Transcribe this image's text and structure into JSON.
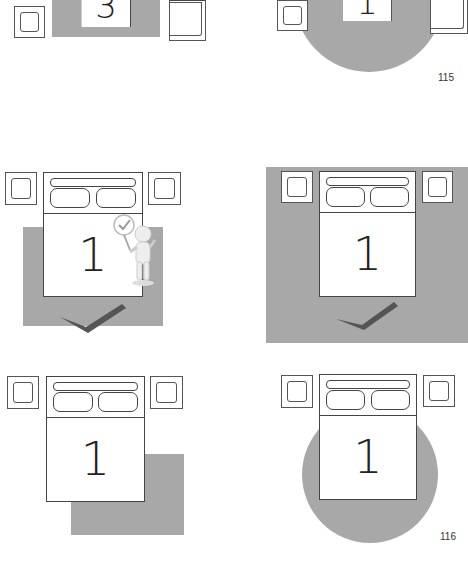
{
  "page": {
    "top_page_number": "115",
    "bottom_page_number": "116"
  },
  "top_partial": {
    "left_bed_number": "3",
    "right_bed_number": "1"
  },
  "diagrams": [
    {
      "id": "rug-partial-under-bed",
      "bed_number": "1",
      "rug": "rectangle-partial",
      "approved": true,
      "has_figure": true
    },
    {
      "id": "rug-full-under-bed",
      "bed_number": "1",
      "rug": "rectangle-large",
      "approved": true,
      "has_figure": false
    },
    {
      "id": "rug-offset-corner",
      "bed_number": "1",
      "rug": "rectangle-offset",
      "approved": false,
      "has_figure": false
    },
    {
      "id": "rug-round",
      "bed_number": "1",
      "rug": "circle",
      "approved": false,
      "has_figure": false
    }
  ],
  "colors": {
    "rug": "#a8a8a8",
    "line": "#444444",
    "check": "#555555"
  }
}
